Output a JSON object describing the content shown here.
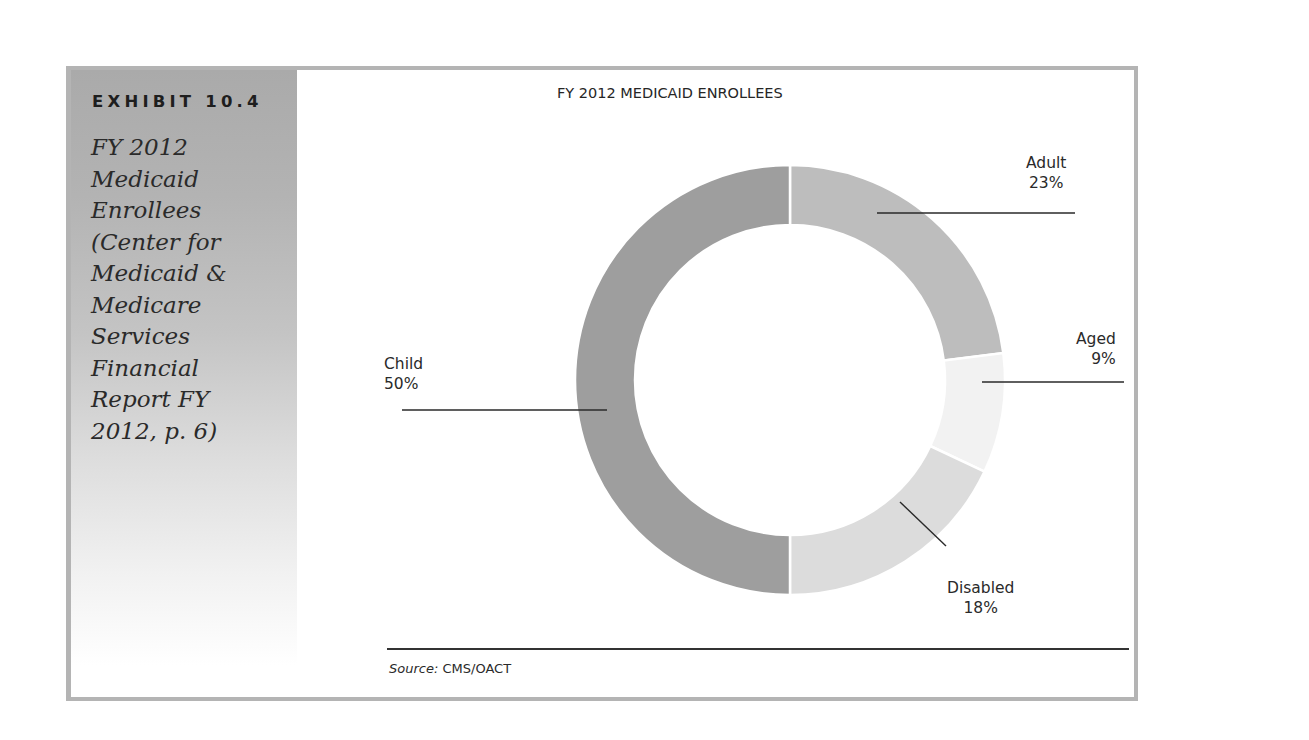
{
  "exhibit": {
    "label": "EXHIBIT 10.4",
    "title_lines": [
      "FY 2012",
      "Medicaid",
      "Enrollees",
      "(Center for",
      "Medicaid &",
      "Medicare",
      "Services",
      "Financial",
      "Report FY",
      "2012, p. 6)"
    ]
  },
  "chart": {
    "title": "FY 2012 MEDICAID ENROLLEES",
    "labels": {
      "adult": {
        "name": "Adult",
        "pct": "23%"
      },
      "aged": {
        "name": "Aged",
        "pct": "9%"
      },
      "disabled": {
        "name": "Disabled",
        "pct": "18%"
      },
      "child": {
        "name": "Child",
        "pct": "50%"
      }
    }
  },
  "source": {
    "prefix": "Source:",
    "text": " CMS/OACT"
  },
  "colors": {
    "adult": "#bdbdbd",
    "aged": "#f2f2f2",
    "disabled": "#dcdcdc",
    "child": "#9e9e9e",
    "frame": "#b4b4b4"
  },
  "chart_data": {
    "type": "pie",
    "subtype": "donut",
    "title": "FY 2012 MEDICAID ENROLLEES",
    "categories": [
      "Adult",
      "Aged",
      "Disabled",
      "Child"
    ],
    "values": [
      23,
      9,
      18,
      50
    ],
    "unit": "%",
    "start_angle": "12 o'clock, clockwise",
    "colors": [
      "#bdbdbd",
      "#f2f2f2",
      "#dcdcdc",
      "#9e9e9e"
    ],
    "legend": "none (leader-line labels)",
    "source": "Source: CMS/OACT",
    "caption": "EXHIBIT 10.4 FY 2012 Medicaid Enrollees (Center for Medicaid & Medicare Services Financial Report FY 2012, p. 6)"
  }
}
